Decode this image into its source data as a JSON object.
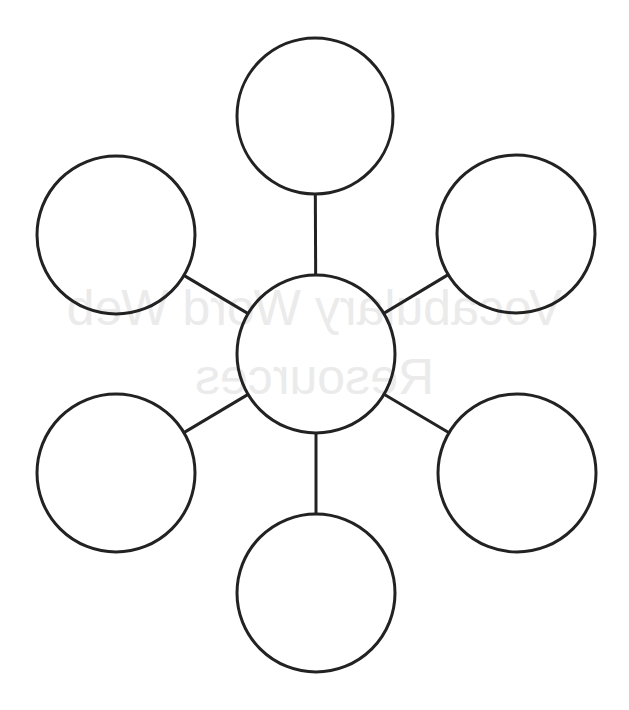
{
  "diagram": {
    "type": "word-web",
    "background_color": "#ffffff",
    "stroke_color": "#222222",
    "stroke_width": 3,
    "bleed_through_text": {
      "mirrored": true,
      "color": "#ebebeb",
      "lines": [
        "Vocabulary Word Web",
        "Resources"
      ]
    },
    "center_node": {
      "id": "center",
      "cx": 316,
      "cy": 354,
      "r": 79,
      "label": ""
    },
    "nodes": [
      {
        "id": "top",
        "cx": 315,
        "cy": 116,
        "r": 78,
        "label": ""
      },
      {
        "id": "upper-left",
        "cx": 116,
        "cy": 235,
        "r": 79,
        "label": ""
      },
      {
        "id": "upper-right",
        "cx": 516,
        "cy": 234,
        "r": 79,
        "label": ""
      },
      {
        "id": "lower-left",
        "cx": 116,
        "cy": 473,
        "r": 79,
        "label": ""
      },
      {
        "id": "lower-right",
        "cx": 517,
        "cy": 473,
        "r": 79,
        "label": ""
      },
      {
        "id": "bottom",
        "cx": 316,
        "cy": 593,
        "r": 79,
        "label": ""
      }
    ],
    "edges": [
      {
        "from": "center",
        "to": "top"
      },
      {
        "from": "center",
        "to": "upper-left"
      },
      {
        "from": "center",
        "to": "upper-right"
      },
      {
        "from": "center",
        "to": "lower-left"
      },
      {
        "from": "center",
        "to": "lower-right"
      },
      {
        "from": "center",
        "to": "bottom"
      }
    ]
  }
}
